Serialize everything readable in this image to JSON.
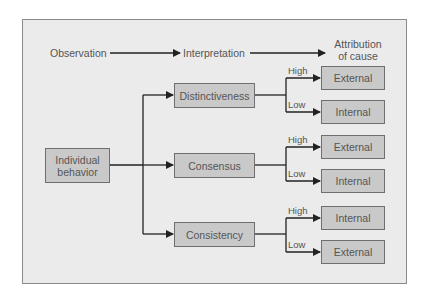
{
  "header": {
    "observation": "Observation",
    "interpretation": "Interpretation",
    "attribution_line1": "Attribution",
    "attribution_line2": "of cause"
  },
  "source": {
    "line1": "Individual",
    "line2": "behavior"
  },
  "factors": [
    {
      "label": "Distinctiveness",
      "branches": [
        {
          "level": "High",
          "result": "External"
        },
        {
          "level": "Low",
          "result": "Internal"
        }
      ]
    },
    {
      "label": "Consensus",
      "branches": [
        {
          "level": "High",
          "result": "External"
        },
        {
          "level": "Low",
          "result": "Internal"
        }
      ]
    },
    {
      "label": "Consistency",
      "branches": [
        {
          "level": "High",
          "result": "Internal"
        },
        {
          "level": "Low",
          "result": "External"
        }
      ]
    }
  ],
  "colors": {
    "frame_bg": "#ebebeb",
    "box_fill": "#c9c9c9",
    "line": "#222222",
    "text": "#555555"
  }
}
